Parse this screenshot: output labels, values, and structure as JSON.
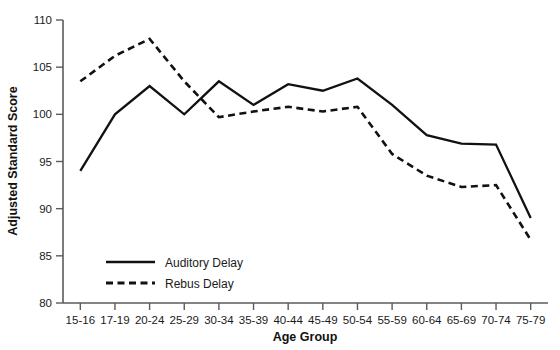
{
  "chart_data": {
    "type": "line",
    "title": "",
    "xlabel": "Age Group",
    "ylabel": "Adjusted Standard Score",
    "categories": [
      "15-16",
      "17-19",
      "20-24",
      "25-29",
      "30-34",
      "35-39",
      "40-44",
      "45-49",
      "50-54",
      "55-59",
      "60-64",
      "65-69",
      "70-74",
      "75-79"
    ],
    "ylim": [
      80,
      110
    ],
    "yticks": [
      80,
      85,
      90,
      95,
      100,
      105,
      110
    ],
    "grid": false,
    "legend_position": "bottom-left",
    "series": [
      {
        "name": "Auditory Delay",
        "style": "solid",
        "color": "#111111",
        "values": [
          94.0,
          100.0,
          103.0,
          100.0,
          103.5,
          101.0,
          103.2,
          102.5,
          103.8,
          101.0,
          97.8,
          96.9,
          96.8,
          89.0
        ]
      },
      {
        "name": "Rebus Delay",
        "style": "dashed",
        "color": "#111111",
        "values": [
          103.5,
          106.2,
          108.0,
          103.5,
          99.7,
          100.3,
          100.8,
          100.3,
          100.8,
          95.8,
          93.5,
          92.3,
          92.5,
          86.7
        ]
      }
    ]
  },
  "legend": {
    "items": [
      {
        "label": "Auditory Delay",
        "style": "solid"
      },
      {
        "label": "Rebus Delay",
        "style": "dashed"
      }
    ]
  }
}
